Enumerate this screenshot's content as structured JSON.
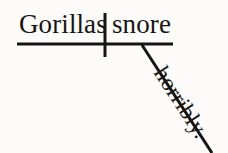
{
  "diagram": {
    "type": "reed-kellogg-sentence-diagram",
    "sentence": "Gorillas snore horribly.",
    "background_color": "#fcfbfa",
    "ink_color": "#171514",
    "subject": {
      "label": "Gorillas",
      "role": "subject",
      "position": "left of vertical divider, above baseline"
    },
    "predicate": {
      "label": "snore",
      "role": "verb",
      "position": "right of vertical divider, above baseline"
    },
    "modifier": {
      "label": "horribly.",
      "role": "adverb",
      "position": "on slanted line descending from verb"
    },
    "lines": {
      "baseline": {
        "name": "horizontal-baseline",
        "x1": 17,
        "y1": 44,
        "x2": 173,
        "y2": 44,
        "stroke_width": 3
      },
      "divider": {
        "name": "subject-verb-divider",
        "x1": 105,
        "y1": 13,
        "x2": 105,
        "y2": 57,
        "stroke_width": 3
      },
      "slant": {
        "name": "adverb-slant-line",
        "x1": 142,
        "y1": 45,
        "x2": 212,
        "y2": 153,
        "stroke_width": 3
      }
    }
  }
}
